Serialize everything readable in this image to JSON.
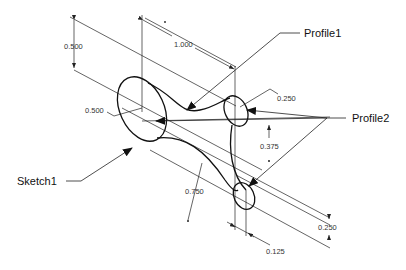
{
  "callouts": {
    "profile1": "Profile1",
    "profile2": "Profile2",
    "sketch1": "Sketch1"
  },
  "dimensions": {
    "d_0500_vertical": "0.500",
    "d_1000": "1.000",
    "d_0500_radius": "0.500",
    "d_0250_top": "0.250",
    "d_0375": "0.375",
    "d_0750": "0.750",
    "d_0250_right": "0.250",
    "d_0125": "0.125"
  },
  "colors": {
    "line": "#111111",
    "background": "#ffffff"
  }
}
